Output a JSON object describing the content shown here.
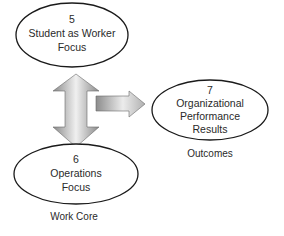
{
  "nodes": {
    "student": {
      "number": "5",
      "line1": "Student as Worker",
      "line2": "Focus"
    },
    "operations": {
      "number": "6",
      "line1": "Operations",
      "line2": "Focus"
    },
    "performance": {
      "number": "7",
      "line1": "Organizational",
      "line2": "Performance",
      "line3": "Results"
    }
  },
  "captions": {
    "outcomes": "Outcomes",
    "work_core": "Work Core"
  },
  "colors": {
    "stroke": "#1a1a1a",
    "arrow_light": "#f2f2f2",
    "arrow_dark": "#8c8c8c"
  }
}
